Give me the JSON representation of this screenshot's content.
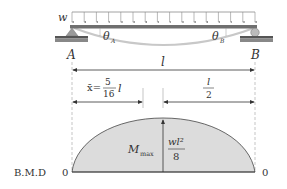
{
  "load": {
    "label": "w",
    "arrow_count": 16
  },
  "beam": {
    "left_support_label": "A",
    "right_support_label": "B",
    "left_slope_label": "θ",
    "left_slope_sub": "A",
    "right_slope_label": "θ",
    "right_slope_sub": "B",
    "span_label": "l"
  },
  "dimensions": {
    "xbar_symbol": "x̄",
    "xbar_eq": "=",
    "xbar_num": "5",
    "xbar_den": "16",
    "xbar_var": "l",
    "half_num": "l",
    "half_den": "2"
  },
  "bmd": {
    "label": "B.M.D",
    "left_zero": "0",
    "right_zero": "0",
    "mmax_label": "M",
    "mmax_sub": "max",
    "mmax_num": "wl²",
    "mmax_den": "8"
  },
  "colors": {
    "beam": "#6f6f6f",
    "fill": "#dcdcdc",
    "line": "#333333",
    "deflection": "#bdbdbd"
  }
}
